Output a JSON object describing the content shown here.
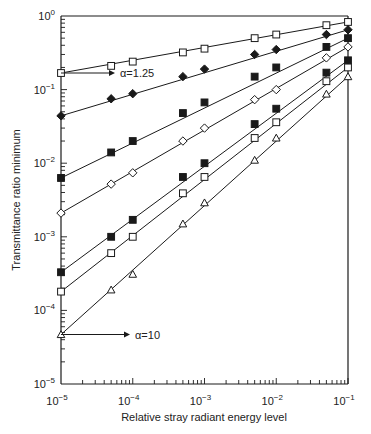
{
  "chart_data": {
    "type": "line",
    "title": "",
    "xlabel": "Relative stray radiant energy level",
    "ylabel": "Transmittance ratio minimum",
    "xscale": "log",
    "yscale": "log",
    "xlim": [
      1e-05,
      0.1
    ],
    "ylim": [
      1e-05,
      1
    ],
    "grid": false,
    "legend": null,
    "x_tick_labels": [
      {
        "base": "10",
        "exp": "-5"
      },
      {
        "base": "10",
        "exp": "-4"
      },
      {
        "base": "10",
        "exp": "-3"
      },
      {
        "base": "10",
        "exp": "-2"
      },
      {
        "base": "10",
        "exp": "-1"
      }
    ],
    "y_tick_labels": [
      {
        "base": "10",
        "exp": "0"
      },
      {
        "base": "10",
        "exp": "-1"
      },
      {
        "base": "10",
        "exp": "-2"
      },
      {
        "base": "10",
        "exp": "-3"
      },
      {
        "base": "10",
        "exp": "-4"
      },
      {
        "base": "10",
        "exp": "-5"
      }
    ],
    "x": [
      1e-05,
      5e-05,
      0.0001,
      0.0005,
      0.001,
      0.005,
      0.01,
      0.05,
      0.1
    ],
    "series": [
      {
        "name": "alpha=1.25",
        "marker": "open-square",
        "values": [
          0.168,
          0.21,
          0.24,
          0.32,
          0.36,
          0.5,
          0.56,
          0.75,
          0.83
        ]
      },
      {
        "name": "series-2",
        "marker": "filled-diamond",
        "values": [
          0.044,
          0.075,
          0.088,
          0.15,
          0.19,
          0.3,
          0.35,
          0.56,
          0.65
        ]
      },
      {
        "name": "series-3",
        "marker": "filled-square",
        "values": [
          0.0063,
          0.014,
          0.02,
          0.048,
          0.067,
          0.15,
          0.2,
          0.38,
          0.5
        ]
      },
      {
        "name": "series-4",
        "marker": "open-diamond",
        "values": [
          0.0021,
          0.0052,
          0.0074,
          0.02,
          0.03,
          0.073,
          0.1,
          0.27,
          0.38
        ]
      },
      {
        "name": "series-5",
        "marker": "filled-square",
        "values": [
          0.00033,
          0.001,
          0.0017,
          0.0065,
          0.01,
          0.034,
          0.055,
          0.17,
          0.25
        ]
      },
      {
        "name": "series-6",
        "marker": "open-square",
        "values": [
          0.00018,
          0.0006,
          0.001,
          0.0039,
          0.0065,
          0.022,
          0.036,
          0.13,
          0.2
        ]
      },
      {
        "name": "alpha=10",
        "marker": "open-triangle",
        "values": [
          4.7e-05,
          0.00019,
          0.00031,
          0.0015,
          0.0029,
          0.011,
          0.022,
          0.087,
          0.15
        ]
      }
    ],
    "annotations": [
      {
        "text": "α=1.25",
        "points_to": "series alpha=1.25 at x=1e-5"
      },
      {
        "text": "α=10",
        "points_to": "series alpha=10 at x=1e-5"
      }
    ]
  },
  "labels": {
    "xlabel": "Relative stray radiant energy level",
    "ylabel": "Transmittance ratio minimum",
    "annot_top": "α=1.25",
    "annot_bottom": "α=10"
  },
  "colors": {
    "ink": "#1a1a1a",
    "background": "#ffffff"
  }
}
